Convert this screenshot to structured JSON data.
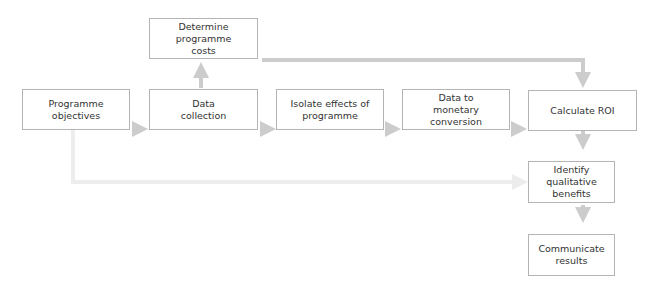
{
  "diagram": {
    "type": "flowchart",
    "colors": {
      "box_border": "#b4b4b4",
      "arrow": "#cccccc",
      "arrow_light": "#ededed",
      "text": "#333333"
    },
    "nodes": [
      {
        "id": "objectives",
        "label": "Programme objectives"
      },
      {
        "id": "collection",
        "label": "Data collection"
      },
      {
        "id": "costs",
        "label": "Determine programme costs"
      },
      {
        "id": "isolate",
        "label": "Isolate effects of programme"
      },
      {
        "id": "monetary",
        "label": "Data to monetary conversion"
      },
      {
        "id": "roi",
        "label": "Calculate ROI"
      },
      {
        "id": "qualitative",
        "label": "Identify qualitative benefits"
      },
      {
        "id": "communicate",
        "label": "Communicate results"
      }
    ],
    "edges": [
      {
        "from": "objectives",
        "to": "collection"
      },
      {
        "from": "collection",
        "to": "costs"
      },
      {
        "from": "collection",
        "to": "isolate"
      },
      {
        "from": "isolate",
        "to": "monetary"
      },
      {
        "from": "monetary",
        "to": "roi"
      },
      {
        "from": "costs",
        "to": "roi"
      },
      {
        "from": "roi",
        "to": "qualitative"
      },
      {
        "from": "objectives",
        "to": "qualitative"
      },
      {
        "from": "qualitative",
        "to": "communicate"
      }
    ]
  }
}
